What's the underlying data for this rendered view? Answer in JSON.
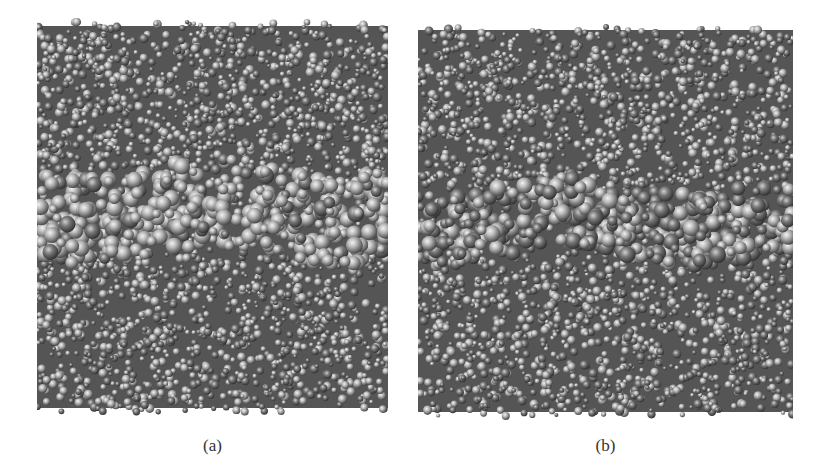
{
  "figure": {
    "panels": [
      {
        "id": "a",
        "label": "(a)",
        "description": "Molecular dynamics snapshot with interfacial layer of larger spheres across middle",
        "box": {
          "x": 37,
          "y": 18,
          "w": 351,
          "h": 398
        },
        "band": {
          "y_top": 162,
          "y_bottom": 262
        },
        "band_style": "light",
        "seed": 17
      },
      {
        "id": "b",
        "label": "(b)",
        "description": "Molecular dynamics snapshot with darker interfacial layer across middle",
        "box": {
          "x": 418,
          "y": 22,
          "w": 375,
          "h": 398
        },
        "band": {
          "y_top": 178,
          "y_bottom": 262
        },
        "band_style": "dark",
        "seed": 53
      }
    ],
    "colors": {
      "background": "#ffffff",
      "bulk_dark": "#4a4a4a",
      "bulk_mid": "#7a7a7a",
      "sphere_highlight": "#e8e8e8",
      "caption": "#333333"
    }
  }
}
